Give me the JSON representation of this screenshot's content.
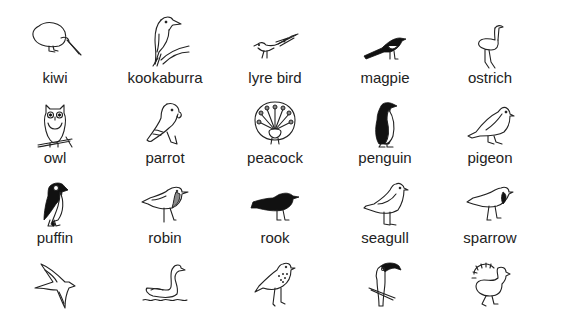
{
  "background_color": "#ffffff",
  "text_color": "#222222",
  "grid": {
    "columns": 5,
    "rows": 4,
    "column_centers_x": [
      55,
      165,
      275,
      385,
      490
    ],
    "icon_rows_y": [
      15,
      95,
      178,
      258
    ],
    "label_rows_y": [
      70,
      150,
      230
    ]
  },
  "birds": [
    {
      "label": "kiwi",
      "icon": "kiwi-icon"
    },
    {
      "label": "kookaburra",
      "icon": "kookaburra-icon"
    },
    {
      "label": "lyre bird",
      "icon": "lyre-bird-icon"
    },
    {
      "label": "magpie",
      "icon": "magpie-icon"
    },
    {
      "label": "ostrich",
      "icon": "ostrich-icon"
    },
    {
      "label": "owl",
      "icon": "owl-icon"
    },
    {
      "label": "parrot",
      "icon": "parrot-icon"
    },
    {
      "label": "peacock",
      "icon": "peacock-icon"
    },
    {
      "label": "penguin",
      "icon": "penguin-icon"
    },
    {
      "label": "pigeon",
      "icon": "pigeon-icon"
    },
    {
      "label": "puffin",
      "icon": "puffin-icon"
    },
    {
      "label": "robin",
      "icon": "robin-icon"
    },
    {
      "label": "rook",
      "icon": "rook-icon"
    },
    {
      "label": "seagull",
      "icon": "seagull-icon"
    },
    {
      "label": "sparrow",
      "icon": "sparrow-icon"
    },
    {
      "label": "",
      "icon": "swallow-icon"
    },
    {
      "label": "",
      "icon": "swan-icon"
    },
    {
      "label": "",
      "icon": "thrush-icon"
    },
    {
      "label": "",
      "icon": "toucan-icon"
    },
    {
      "label": "",
      "icon": "turkey-icon"
    }
  ]
}
